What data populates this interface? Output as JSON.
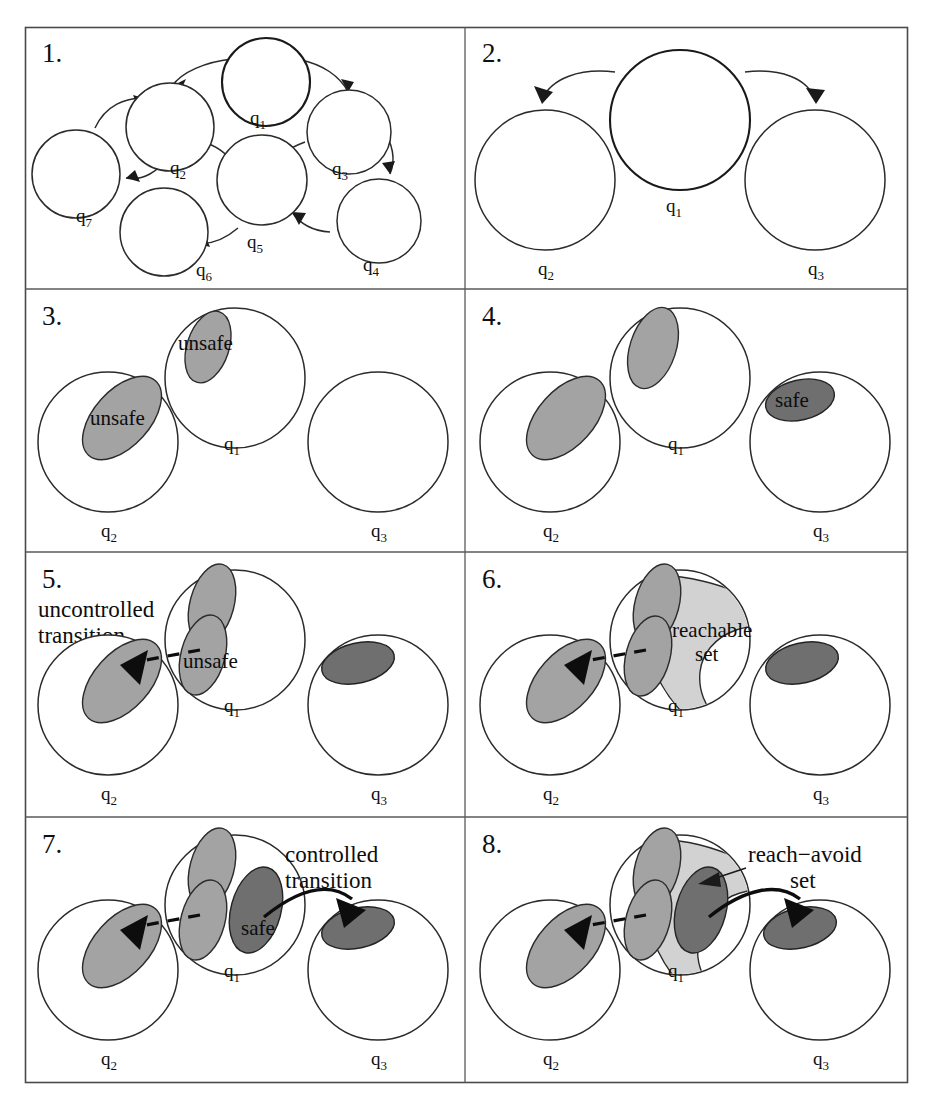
{
  "figure": {
    "background_color": "#ffffff",
    "frame_color": "#4a4a4a",
    "panel_count": 8,
    "grid": "2 columns x 4 rows"
  },
  "palette": {
    "white_fill": "#ffffff",
    "outline": "#2b2b2b",
    "unsafe_gray": "#a3a3a3",
    "safe_dark_gray": "#6f6f6f",
    "reachable_light_gray": "#d2d2d2",
    "arrow_black": "#0d0d0d"
  },
  "panels": [
    {
      "number": "1.",
      "states": [
        {
          "label": "q",
          "sub": "1"
        },
        {
          "label": "q",
          "sub": "2"
        },
        {
          "label": "q",
          "sub": "3"
        },
        {
          "label": "q",
          "sub": "4"
        },
        {
          "label": "q",
          "sub": "5"
        },
        {
          "label": "q",
          "sub": "6"
        },
        {
          "label": "q",
          "sub": "7"
        }
      ],
      "transitions": [
        {
          "from": "q1",
          "to": "q2"
        },
        {
          "from": "q2",
          "to": "q7"
        },
        {
          "from": "q7",
          "to": "q2"
        },
        {
          "from": "q1",
          "to": "q3"
        },
        {
          "from": "q2",
          "to": "q5"
        },
        {
          "from": "q3",
          "to": "q5"
        },
        {
          "from": "q3",
          "to": "q4"
        },
        {
          "from": "q4",
          "to": "q5"
        },
        {
          "from": "q5",
          "to": "q6"
        }
      ],
      "annotations": []
    },
    {
      "number": "2.",
      "states": [
        {
          "label": "q",
          "sub": "1"
        },
        {
          "label": "q",
          "sub": "2"
        },
        {
          "label": "q",
          "sub": "3"
        }
      ],
      "transitions": [
        {
          "from": "q1",
          "to": "q2"
        },
        {
          "from": "q1",
          "to": "q3"
        }
      ],
      "annotations": []
    },
    {
      "number": "3.",
      "states": [
        {
          "label": "q",
          "sub": "1"
        },
        {
          "label": "q",
          "sub": "2"
        },
        {
          "label": "q",
          "sub": "3"
        }
      ],
      "regions": [
        {
          "in_state": "q1",
          "kind": "unsafe",
          "label": "unsafe",
          "color": "#a3a3a3"
        },
        {
          "in_state": "q2",
          "kind": "unsafe",
          "label": "unsafe",
          "color": "#a3a3a3"
        }
      ],
      "annotations": [
        "unsafe",
        "unsafe"
      ]
    },
    {
      "number": "4.",
      "states": [
        {
          "label": "q",
          "sub": "1"
        },
        {
          "label": "q",
          "sub": "2"
        },
        {
          "label": "q",
          "sub": "3"
        }
      ],
      "regions": [
        {
          "in_state": "q1",
          "kind": "unsafe",
          "label": "",
          "color": "#a3a3a3"
        },
        {
          "in_state": "q2",
          "kind": "unsafe",
          "label": "",
          "color": "#a3a3a3"
        },
        {
          "in_state": "q3",
          "kind": "safe",
          "label": "safe",
          "color": "#6f6f6f"
        }
      ],
      "annotations": [
        "safe"
      ]
    },
    {
      "number": "5.",
      "states": [
        {
          "label": "q",
          "sub": "1"
        },
        {
          "label": "q",
          "sub": "2"
        },
        {
          "label": "q",
          "sub": "3"
        }
      ],
      "regions": [
        {
          "in_state": "q1",
          "kind": "unsafe",
          "label": "",
          "color": "#a3a3a3"
        },
        {
          "in_state": "q1",
          "kind": "unsafe-guard",
          "label": "unsafe",
          "color": "#a3a3a3"
        },
        {
          "in_state": "q2",
          "kind": "unsafe",
          "label": "",
          "color": "#a3a3a3"
        },
        {
          "in_state": "q3",
          "kind": "safe",
          "label": "",
          "color": "#6f6f6f"
        }
      ],
      "callout": {
        "line1": "uncontrolled",
        "line2": "transition",
        "arrow": "dashed"
      },
      "annotations": [
        "unsafe"
      ]
    },
    {
      "number": "6.",
      "states": [
        {
          "label": "q",
          "sub": "1"
        },
        {
          "label": "q",
          "sub": "2"
        },
        {
          "label": "q",
          "sub": "3"
        }
      ],
      "regions": [
        {
          "in_state": "q1",
          "kind": "reachable",
          "label": "",
          "color": "#d2d2d2"
        },
        {
          "in_state": "q1",
          "kind": "unsafe",
          "label": "",
          "color": "#a3a3a3"
        },
        {
          "in_state": "q1",
          "kind": "unsafe-guard",
          "label": "",
          "color": "#a3a3a3"
        },
        {
          "in_state": "q2",
          "kind": "unsafe",
          "label": "",
          "color": "#a3a3a3"
        },
        {
          "in_state": "q3",
          "kind": "safe",
          "label": "",
          "color": "#6f6f6f"
        }
      ],
      "callout": {
        "line1": "reachable",
        "line2": "set",
        "arrow": "dashed"
      },
      "annotations": [
        "reachable",
        "set"
      ]
    },
    {
      "number": "7.",
      "states": [
        {
          "label": "q",
          "sub": "1"
        },
        {
          "label": "q",
          "sub": "2"
        },
        {
          "label": "q",
          "sub": "3"
        }
      ],
      "regions": [
        {
          "in_state": "q1",
          "kind": "unsafe",
          "label": "",
          "color": "#a3a3a3"
        },
        {
          "in_state": "q1",
          "kind": "unsafe-guard",
          "label": "",
          "color": "#a3a3a3"
        },
        {
          "in_state": "q1",
          "kind": "safe",
          "label": "safe",
          "color": "#6f6f6f"
        },
        {
          "in_state": "q2",
          "kind": "unsafe",
          "label": "",
          "color": "#a3a3a3"
        },
        {
          "in_state": "q3",
          "kind": "safe",
          "label": "",
          "color": "#6f6f6f"
        }
      ],
      "callout": {
        "line1": "controlled",
        "line2": "transition",
        "arrow": "solid"
      },
      "annotations": [
        "safe"
      ]
    },
    {
      "number": "8.",
      "states": [
        {
          "label": "q",
          "sub": "1"
        },
        {
          "label": "q",
          "sub": "2"
        },
        {
          "label": "q",
          "sub": "3"
        }
      ],
      "regions": [
        {
          "in_state": "q1",
          "kind": "reach-avoid",
          "label": "",
          "color": "#d2d2d2"
        },
        {
          "in_state": "q1",
          "kind": "unsafe",
          "label": "",
          "color": "#a3a3a3"
        },
        {
          "in_state": "q1",
          "kind": "unsafe-guard",
          "label": "",
          "color": "#a3a3a3"
        },
        {
          "in_state": "q1",
          "kind": "safe",
          "label": "",
          "color": "#6f6f6f"
        },
        {
          "in_state": "q2",
          "kind": "unsafe",
          "label": "",
          "color": "#a3a3a3"
        },
        {
          "in_state": "q3",
          "kind": "safe",
          "label": "",
          "color": "#6f6f6f"
        }
      ],
      "callout": {
        "line1": "reach−avoid",
        "line2": "set",
        "arrow": "pointer"
      },
      "annotations": [
        "reach−avoid",
        "set"
      ]
    }
  ],
  "labels": {
    "q1": "q",
    "q1_sub": "1",
    "q2": "q",
    "q2_sub": "2",
    "q3": "q",
    "q3_sub": "3",
    "q4": "q",
    "q4_sub": "4",
    "q5": "q",
    "q5_sub": "5",
    "q6": "q",
    "q6_sub": "6",
    "q7": "q",
    "q7_sub": "7",
    "unsafe": "unsafe",
    "safe": "safe",
    "uncontrolled": "uncontrolled",
    "transition": "transition",
    "controlled": "controlled",
    "reachable": "reachable",
    "set": "set",
    "reach_avoid": "reach−avoid",
    "p1": "1.",
    "p2": "2.",
    "p3": "3.",
    "p4": "4.",
    "p5": "5.",
    "p6": "6.",
    "p7": "7.",
    "p8": "8."
  }
}
